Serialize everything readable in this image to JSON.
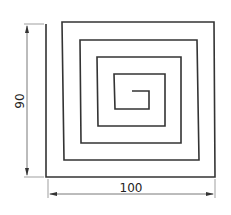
{
  "diagram": {
    "type": "technical-drawing",
    "colors": {
      "line": "#333333",
      "dimension": "#555555",
      "background": "#ffffff"
    },
    "dimensions": {
      "height_label": "90",
      "width_label": "100"
    },
    "spiral_path": [
      [
        46,
        24
      ],
      [
        46,
        177
      ],
      [
        215,
        177
      ],
      [
        214,
        22
      ],
      [
        62,
        22
      ],
      [
        64,
        160
      ],
      [
        199,
        160
      ],
      [
        197,
        40
      ],
      [
        80,
        40
      ],
      [
        81,
        143
      ],
      [
        181,
        143
      ],
      [
        181,
        57
      ],
      [
        97,
        57
      ],
      [
        98,
        126
      ],
      [
        165,
        126
      ],
      [
        165,
        74
      ],
      [
        114,
        74
      ],
      [
        115,
        109
      ],
      [
        149,
        109
      ],
      [
        149,
        91
      ],
      [
        132,
        91
      ]
    ]
  }
}
